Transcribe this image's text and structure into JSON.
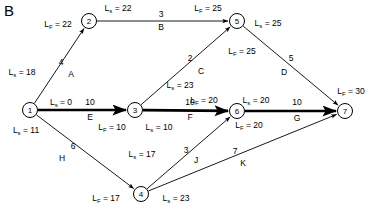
{
  "panel": {
    "letter": "B"
  },
  "diagram": {
    "type": "activity-on-arrow-network",
    "nodes": [
      {
        "id": "1",
        "label": "1",
        "x": 30,
        "y": 110
      },
      {
        "id": "2",
        "label": "2",
        "x": 89,
        "y": 21
      },
      {
        "id": "3",
        "label": "3",
        "x": 135,
        "y": 110
      },
      {
        "id": "4",
        "label": "4",
        "x": 141,
        "y": 194
      },
      {
        "id": "5",
        "label": "5",
        "x": 237,
        "y": 21
      },
      {
        "id": "6",
        "label": "6",
        "x": 237,
        "y": 111
      },
      {
        "id": "7",
        "label": "7",
        "x": 345,
        "y": 111
      }
    ],
    "edges": [
      {
        "name": "A",
        "duration": "4",
        "from": "1",
        "to": "2",
        "bold": false
      },
      {
        "name": "B",
        "duration": "3",
        "from": "2",
        "to": "5",
        "bold": false
      },
      {
        "name": "C",
        "duration": "2",
        "from": "3",
        "to": "5",
        "bold": false
      },
      {
        "name": "D",
        "duration": "5",
        "from": "5",
        "to": "7",
        "bold": false
      },
      {
        "name": "E",
        "duration": "10",
        "from": "1",
        "to": "3",
        "bold": true
      },
      {
        "name": "F",
        "duration": "10",
        "from": "3",
        "to": "6",
        "bold": true
      },
      {
        "name": "G",
        "duration": "10",
        "from": "6",
        "to": "7",
        "bold": true
      },
      {
        "name": "H",
        "duration": "6",
        "from": "1",
        "to": "4",
        "bold": false
      },
      {
        "name": "J",
        "duration": "3",
        "from": "4",
        "to": "6",
        "bold": false
      },
      {
        "name": "K",
        "duration": "7",
        "from": "4",
        "to": "7",
        "bold": false
      }
    ],
    "time_labels": [
      {
        "id": "n1-ls",
        "kind": "Ls",
        "value": "0",
        "x": 61,
        "y": 103,
        "node": "1"
      },
      {
        "id": "n1-ls-alt",
        "kind": "Ls",
        "value": "11",
        "x": 26,
        "y": 131,
        "node": "1"
      },
      {
        "id": "n1-lf",
        "kind": "Ls",
        "value": "18",
        "x": 22,
        "y": 73,
        "node": "1"
      },
      {
        "id": "n2-lf",
        "kind": "Lf",
        "value": "22",
        "x": 58,
        "y": 25,
        "node": "2"
      },
      {
        "id": "n2-ls",
        "kind": "Ls",
        "value": "22",
        "x": 118,
        "y": 9,
        "node": "2"
      },
      {
        "id": "n3-lf",
        "kind": "Lf",
        "value": "10",
        "x": 112,
        "y": 128,
        "node": "3"
      },
      {
        "id": "n3-ls",
        "kind": "Ls",
        "value": "10",
        "x": 159,
        "y": 128,
        "node": "3"
      },
      {
        "id": "n3-ls2",
        "kind": "Ls",
        "value": "23",
        "x": 180,
        "y": 86,
        "node": "3"
      },
      {
        "id": "n5-lf",
        "kind": "Lf",
        "value": "25",
        "x": 208,
        "y": 9,
        "node": "5"
      },
      {
        "id": "n5-ls",
        "kind": "Ls",
        "value": "25",
        "x": 268,
        "y": 24,
        "node": "5"
      },
      {
        "id": "n5-lf2",
        "kind": "Lf",
        "value": "25",
        "x": 242,
        "y": 52,
        "node": "5"
      },
      {
        "id": "n6-lf",
        "kind": "Lf",
        "value": "20",
        "x": 204,
        "y": 101,
        "node": "6"
      },
      {
        "id": "n6-ls",
        "kind": "Ls",
        "value": "20",
        "x": 256,
        "y": 101,
        "node": "6"
      },
      {
        "id": "n6-lf2",
        "kind": "Lf",
        "value": "20",
        "x": 249,
        "y": 126,
        "node": "6"
      },
      {
        "id": "n4-lf",
        "kind": "Lf",
        "value": "17",
        "x": 106,
        "y": 199,
        "node": "4"
      },
      {
        "id": "n4-ls",
        "kind": "Ls",
        "value": "23",
        "x": 176,
        "y": 199,
        "node": "4"
      },
      {
        "id": "n4-ls2",
        "kind": "Ls",
        "value": "17",
        "x": 142,
        "y": 155,
        "node": "4"
      },
      {
        "id": "n7-lf",
        "kind": "Lf",
        "value": "30",
        "x": 351,
        "y": 92,
        "node": "7"
      }
    ],
    "duration_labels": [
      {
        "edge": "A",
        "x": 61,
        "y": 62
      },
      {
        "edge": "B",
        "x": 161,
        "y": 14
      },
      {
        "edge": "C",
        "x": 190,
        "y": 58
      },
      {
        "edge": "D",
        "x": 291,
        "y": 58
      },
      {
        "edge": "E",
        "x": 90,
        "y": 102
      },
      {
        "edge": "F",
        "x": 190,
        "y": 102
      },
      {
        "edge": "G",
        "x": 297,
        "y": 102
      },
      {
        "edge": "H",
        "x": 73,
        "y": 146
      },
      {
        "edge": "J",
        "x": 186,
        "y": 150
      },
      {
        "edge": "K",
        "x": 235,
        "y": 151
      }
    ],
    "name_labels": [
      {
        "edge": "A",
        "x": 71,
        "y": 74
      },
      {
        "edge": "B",
        "x": 161,
        "y": 27
      },
      {
        "edge": "C",
        "x": 201,
        "y": 71
      },
      {
        "edge": "D",
        "x": 284,
        "y": 72
      },
      {
        "edge": "E",
        "x": 90,
        "y": 117
      },
      {
        "edge": "F",
        "x": 190,
        "y": 117
      },
      {
        "edge": "G",
        "x": 297,
        "y": 118
      },
      {
        "edge": "H",
        "x": 62,
        "y": 158
      },
      {
        "edge": "J",
        "x": 196,
        "y": 160
      },
      {
        "edge": "K",
        "x": 243,
        "y": 163
      }
    ],
    "symbols": {
      "Ls": "L",
      "Lf": "L",
      "Ls_sub": "s",
      "Lf_sub": "F",
      "equals": "="
    },
    "colors": {
      "stroke": "#000000",
      "background": "#ffffff",
      "text": "#000000"
    }
  }
}
